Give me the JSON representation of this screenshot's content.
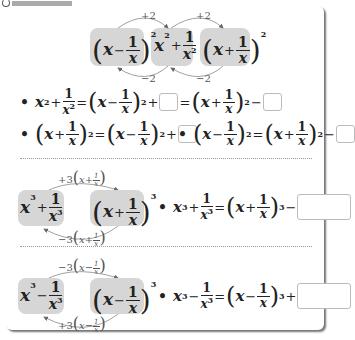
{
  "header": {
    "label_icon": "circle-icon"
  },
  "top_diagram": {
    "left": {
      "base": "x",
      "op": "−",
      "num": "1",
      "den": "x",
      "exp": "2"
    },
    "middle": {
      "base": "x",
      "exp": "2",
      "op": "+",
      "num": "1",
      "den": "x",
      "den_exp": "2"
    },
    "right": {
      "base": "x",
      "op": "+",
      "num": "1",
      "den": "x",
      "exp": "2"
    },
    "arrows": {
      "top_left": "+2",
      "top_right": "+2",
      "bottom_left": "−2",
      "bottom_right": "−2"
    }
  },
  "identities": {
    "row1": {
      "lhs_base": "x",
      "lhs_exp": "2",
      "plus": "+",
      "num": "1",
      "den": "x",
      "den_exp": "2",
      "eq": "=",
      "t1_base": "x",
      "t1_op": "−",
      "t1_num": "1",
      "t1_den": "x",
      "t1_exp": "2",
      "t1_sign": "+",
      "eq2": "=",
      "t2_base": "x",
      "t2_op": "+",
      "t2_num": "1",
      "t2_den": "x",
      "t2_exp": "2",
      "t2_sign": "−"
    },
    "row2a": {
      "l_base": "x",
      "l_op": "+",
      "l_num": "1",
      "l_den": "x",
      "l_exp": "2",
      "eq": "=",
      "r_base": "x",
      "r_op": "−",
      "r_num": "1",
      "r_den": "x",
      "r_exp": "2",
      "sign": "+"
    },
    "row2b": {
      "l_base": "x",
      "l_op": "−",
      "l_num": "1",
      "l_den": "x",
      "l_exp": "2",
      "eq": "=",
      "r_base": "x",
      "r_op": "+",
      "r_num": "1",
      "r_den": "x",
      "r_exp": "2",
      "sign": "−"
    }
  },
  "cube_plus": {
    "left": {
      "base": "x",
      "exp": "3",
      "op": "+",
      "num": "1",
      "den": "x",
      "den_exp": "3"
    },
    "right": {
      "base": "x",
      "op": "+",
      "num": "1",
      "den": "x",
      "exp": "3"
    },
    "arrow_top": {
      "coef": "+3",
      "base": "x",
      "op": "+",
      "num": "1",
      "den": "x"
    },
    "arrow_bottom": {
      "coef": "−3",
      "base": "x",
      "op": "+",
      "num": "1",
      "den": "x"
    },
    "identity": {
      "lhs_base": "x",
      "lhs_exp": "3",
      "op": "+",
      "num": "1",
      "den": "x",
      "den_exp": "3",
      "eq": "=",
      "r_base": "x",
      "r_op": "+",
      "r_num": "1",
      "r_den": "x",
      "r_exp": "3",
      "sign": "−"
    }
  },
  "cube_minus": {
    "left": {
      "base": "x",
      "exp": "3",
      "op": "−",
      "num": "1",
      "den": "x",
      "den_exp": "3"
    },
    "right": {
      "base": "x",
      "op": "−",
      "num": "1",
      "den": "x",
      "exp": "3"
    },
    "arrow_top": {
      "coef": "−3",
      "base": "x",
      "op": "−",
      "num": "1",
      "den": "x"
    },
    "arrow_bottom": {
      "coef": "+3",
      "base": "x",
      "op": "−",
      "num": "1",
      "den": "x"
    },
    "identity": {
      "lhs_base": "x",
      "lhs_exp": "3",
      "op": "−",
      "num": "1",
      "den": "x",
      "den_exp": "3",
      "eq": "=",
      "r_base": "x",
      "r_op": "−",
      "r_num": "1",
      "r_den": "x",
      "r_exp": "3",
      "sign": "+"
    }
  },
  "answers": {
    "a1": "",
    "a2": "",
    "a3": "",
    "a4": "",
    "a5": "",
    "a6": ""
  }
}
